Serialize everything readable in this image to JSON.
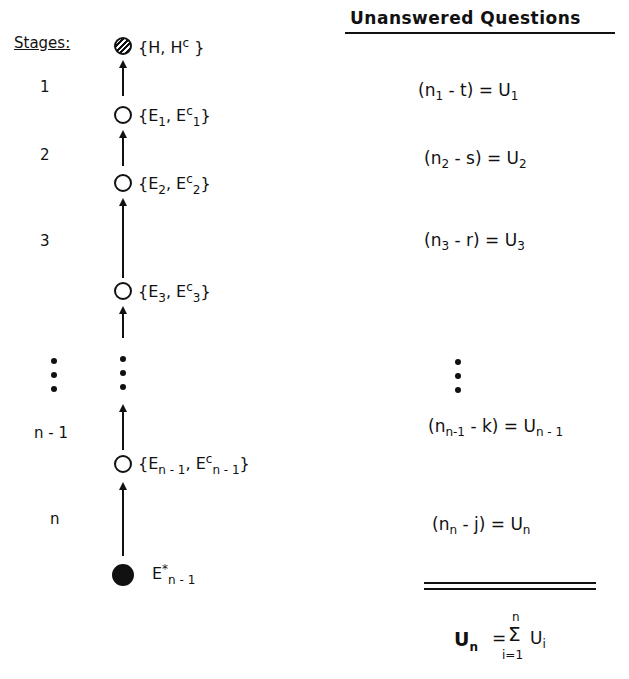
{
  "left": {
    "header": "Stages:",
    "stage_labels": [
      "1",
      "2",
      "3",
      "n - 1",
      "n"
    ],
    "nodes": [
      {
        "kind": "hatched",
        "set": "{H, H",
        "sup": "c",
        "close": "}"
      },
      {
        "kind": "open",
        "a": "E",
        "a_sub": "1",
        "b": "E",
        "b_sup": "c",
        "b_sub": "1"
      },
      {
        "kind": "open",
        "a": "E",
        "a_sub": "2",
        "b": "E",
        "b_sup": "c",
        "b_sub": "2"
      },
      {
        "kind": "open",
        "a": "E",
        "a_sub": "3",
        "b": "E",
        "b_sup": "c",
        "b_sub": "3"
      },
      {
        "kind": "open",
        "a": "E",
        "a_sub": "n - 1",
        "b": "E",
        "b_sup": "c",
        "b_sub": "n - 1"
      },
      {
        "kind": "filled",
        "a": "E",
        "a_sup": "*",
        "a_sub": "n - 1"
      }
    ]
  },
  "right": {
    "header": "Unanswered Questions",
    "equations": [
      {
        "n_sub": "1",
        "minus": "t",
        "u_sub": "1"
      },
      {
        "n_sub": "2",
        "minus": "s",
        "u_sub": "2"
      },
      {
        "n_sub": "3",
        "minus": "r",
        "u_sub": "3"
      },
      {
        "n_sub": "n-1",
        "minus": "k",
        "u_sub": "n - 1"
      },
      {
        "n_sub": "n",
        "minus": "j",
        "u_sub": "n"
      }
    ],
    "total": {
      "lhs": "U",
      "lhs_sub": "n",
      "sum_upper": "n",
      "sum_lower": "i=1",
      "sum_symbol": "Σ",
      "term": "U",
      "term_sub": "i"
    }
  }
}
